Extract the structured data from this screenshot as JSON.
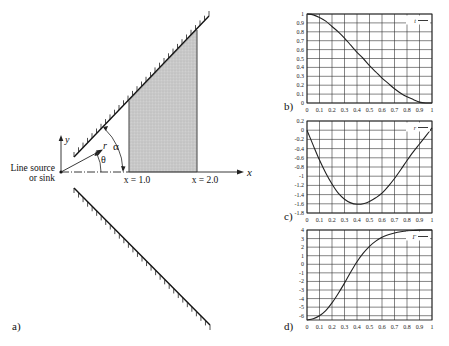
{
  "figure": {
    "panel_a": {
      "label": "a)",
      "source_label_line1": "Line source",
      "source_label_line2": "or sink",
      "axis_y": "y",
      "axis_x": "x",
      "radius_label": "r",
      "theta_label": "θ",
      "alpha_label": "α",
      "x1_label": "x = 1.0",
      "x2_label": "x = 2.0",
      "shaded_region_color": "#c8c8c8"
    },
    "panel_b": {
      "label": "b)"
    },
    "panel_c": {
      "label": "c)"
    },
    "panel_d": {
      "label": "d)"
    }
  },
  "chart_data": [
    {
      "type": "line",
      "panel": "b)",
      "title": "",
      "xlabel": "",
      "ylabel": "",
      "xlim": [
        0,
        1
      ],
      "ylim": [
        0,
        1
      ],
      "grid": true,
      "legend_position": "top-right",
      "x_ticks": [
        "0",
        "0.1",
        "0.2",
        "0.3",
        "0.4",
        "0.5",
        "0.6",
        "0.7",
        "0.8",
        "0.9",
        "1"
      ],
      "y_ticks": [
        "0",
        "0.1",
        "0.2",
        "0.3",
        "0.4",
        "0.5",
        "0.6",
        "0.7",
        "0.8",
        "0.9",
        "1"
      ],
      "series": [
        {
          "name": "t",
          "x": [
            0,
            0.05,
            0.1,
            0.15,
            0.2,
            0.25,
            0.3,
            0.35,
            0.4,
            0.45,
            0.5,
            0.55,
            0.6,
            0.65,
            0.7,
            0.75,
            0.8,
            0.85,
            0.9,
            0.95,
            1.0
          ],
          "values": [
            1.0,
            0.99,
            0.96,
            0.92,
            0.86,
            0.8,
            0.73,
            0.65,
            0.57,
            0.5,
            0.42,
            0.35,
            0.28,
            0.22,
            0.16,
            0.11,
            0.07,
            0.04,
            0.01,
            0.0,
            0.0
          ]
        }
      ]
    },
    {
      "type": "line",
      "panel": "c)",
      "title": "",
      "xlabel": "",
      "ylabel": "",
      "xlim": [
        0,
        1
      ],
      "ylim": [
        -1.8,
        0.2
      ],
      "grid": true,
      "legend_position": "top-right",
      "x_ticks": [
        "0",
        "0.1",
        "0.2",
        "0.3",
        "0.4",
        "0.5",
        "0.6",
        "0.7",
        "0.8",
        "0.9",
        "1"
      ],
      "y_ticks": [
        "0.2",
        "0",
        "-0.2",
        "-0.4",
        "-0.6",
        "-0.8",
        "-1",
        "-1.2",
        "-1.4",
        "-1.6",
        "-1.8"
      ],
      "series": [
        {
          "name": "r",
          "x": [
            0,
            0.05,
            0.1,
            0.15,
            0.2,
            0.25,
            0.3,
            0.35,
            0.4,
            0.45,
            0.5,
            0.55,
            0.6,
            0.65,
            0.7,
            0.75,
            0.8,
            0.85,
            0.9,
            0.95,
            1.0
          ],
          "values": [
            0.0,
            -0.33,
            -0.65,
            -0.93,
            -1.17,
            -1.37,
            -1.5,
            -1.58,
            -1.61,
            -1.6,
            -1.55,
            -1.47,
            -1.37,
            -1.22,
            -1.05,
            -0.86,
            -0.66,
            -0.47,
            -0.3,
            -0.13,
            0.05
          ]
        }
      ]
    },
    {
      "type": "line",
      "panel": "d)",
      "title": "",
      "xlabel": "",
      "ylabel": "",
      "xlim": [
        0,
        1
      ],
      "ylim": [
        -6.5,
        4
      ],
      "grid": true,
      "legend_position": "top-right",
      "x_ticks": [
        "0",
        "0.1",
        "0.2",
        "0.3",
        "0.4",
        "0.5",
        "0.6",
        "0.7",
        "0.8",
        "0.9",
        "1"
      ],
      "y_ticks": [
        "4",
        "3",
        "2",
        "1",
        "0",
        "-1",
        "-2",
        "-3",
        "-4",
        "-5",
        "-6"
      ],
      "series": [
        {
          "name": "Γ",
          "x": [
            0,
            0.05,
            0.1,
            0.15,
            0.2,
            0.25,
            0.3,
            0.35,
            0.4,
            0.45,
            0.5,
            0.55,
            0.6,
            0.65,
            0.7,
            0.75,
            0.8,
            0.85,
            0.9,
            0.95,
            1.0
          ],
          "values": [
            -6.5,
            -6.35,
            -6.0,
            -5.4,
            -4.5,
            -3.4,
            -2.2,
            -0.9,
            0.3,
            1.3,
            2.1,
            2.7,
            3.15,
            3.45,
            3.65,
            3.8,
            3.9,
            3.95,
            3.98,
            4.0,
            4.0
          ]
        }
      ]
    }
  ]
}
